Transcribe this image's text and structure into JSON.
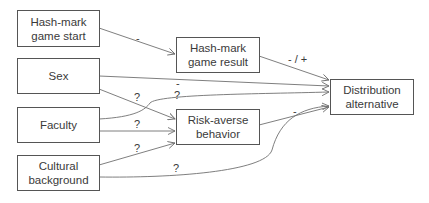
{
  "nodes": {
    "hashmark_start": {
      "label_line1": "Hash-mark",
      "label_line2": "game start"
    },
    "sex": {
      "label": "Sex"
    },
    "faculty": {
      "label": "Faculty"
    },
    "cultural": {
      "label_line1": "Cultural",
      "label_line2": "background"
    },
    "hashmark_result": {
      "label_line1": "Hash-mark",
      "label_line2": "game result"
    },
    "risk_averse": {
      "label_line1": "Risk-averse",
      "label_line2": "behavior"
    },
    "distribution": {
      "label_line1": "Distribution",
      "label_line2": "alternative"
    }
  },
  "edges": [
    {
      "from": "Hash-mark game start",
      "to": "Hash-mark game result",
      "label": "-"
    },
    {
      "from": "Hash-mark game result",
      "to": "Distribution alternative",
      "label": "- / +"
    },
    {
      "from": "Sex",
      "to": "Distribution alternative",
      "label": "-"
    },
    {
      "from": "Sex",
      "to": "Risk-averse behavior",
      "label": "?"
    },
    {
      "from": "Faculty",
      "to": "Distribution alternative",
      "label": "?"
    },
    {
      "from": "Faculty",
      "to": "Risk-averse behavior",
      "label": "?"
    },
    {
      "from": "Cultural background",
      "to": "Risk-averse behavior",
      "label": "?"
    },
    {
      "from": "Cultural background",
      "to": "Distribution alternative",
      "label": "?"
    },
    {
      "from": "Risk-averse behavior",
      "to": "Distribution alternative",
      "label": "-"
    }
  ],
  "colors": {
    "line": "#707070",
    "border": "#555555",
    "text": "#3a3a3a"
  }
}
